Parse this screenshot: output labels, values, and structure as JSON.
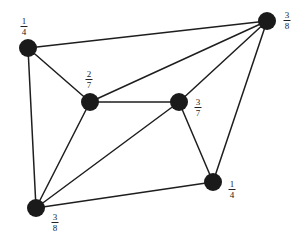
{
  "diagram": {
    "title": "",
    "background": "#ffffff",
    "node_color": "#1a1a1a",
    "edge_color": "#1e1e1e",
    "node_radius": 9,
    "nodes": [
      {
        "id": "A",
        "x": 28,
        "y": 48,
        "label": {
          "num": "1",
          "den": "4",
          "x": 24,
          "y": 17
        }
      },
      {
        "id": "B",
        "x": 90,
        "y": 102,
        "label": {
          "num": "2",
          "den": "7",
          "x": 89,
          "y": 70
        }
      },
      {
        "id": "C",
        "x": 179,
        "y": 102,
        "label": {
          "num": "3",
          "den": "7",
          "x": 198,
          "y": 98
        }
      },
      {
        "id": "D",
        "x": 267,
        "y": 21,
        "label": {
          "num": "3",
          "den": "8",
          "x": 287,
          "y": 11
        }
      },
      {
        "id": "E",
        "x": 213,
        "y": 182,
        "label": {
          "num": "1",
          "den": "4",
          "x": 232,
          "y": 180
        }
      },
      {
        "id": "F",
        "x": 36,
        "y": 208,
        "label": {
          "num": "3",
          "den": "8",
          "x": 55,
          "y": 213
        }
      }
    ],
    "edges": [
      [
        "A",
        "D"
      ],
      [
        "A",
        "B"
      ],
      [
        "A",
        "F"
      ],
      [
        "B",
        "C"
      ],
      [
        "B",
        "D"
      ],
      [
        "B",
        "F"
      ],
      [
        "C",
        "D"
      ],
      [
        "C",
        "F"
      ],
      [
        "C",
        "E"
      ],
      [
        "E",
        "D"
      ],
      [
        "E",
        "F"
      ]
    ]
  }
}
